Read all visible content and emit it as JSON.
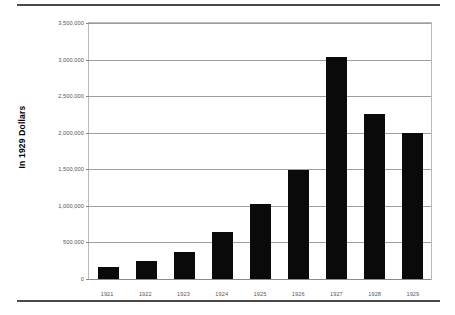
{
  "chart_data": {
    "type": "bar",
    "title": "",
    "xlabel": "",
    "ylabel": "In 1929 Dollars",
    "categories": [
      "1921",
      "1922",
      "1923",
      "1924",
      "1925",
      "1926",
      "1927",
      "1928",
      "1929"
    ],
    "values": [
      160000,
      250000,
      375000,
      645000,
      1030000,
      1485000,
      3040000,
      2255000,
      2000000
    ],
    "ylim": [
      0,
      3500000
    ],
    "ytick_values": [
      0,
      500000,
      1000000,
      1500000,
      2000000,
      2500000,
      3000000,
      3500000
    ],
    "ytick_labels": [
      "0",
      "500,000",
      "1,000,000",
      "1,500,000",
      "2,000,000",
      "2,500,000",
      "3,000,000",
      "3,500,000"
    ],
    "grid": true,
    "legend": false,
    "legend_position": "none",
    "bar_color": "#0a0a0a",
    "gridline_color": "#9d9d9d",
    "plot_border_color": "#b9b9b9",
    "background_color": "#ffffff",
    "tick_label_color": "#555555"
  },
  "decor": {
    "rule_color": "#4a4a4a"
  }
}
